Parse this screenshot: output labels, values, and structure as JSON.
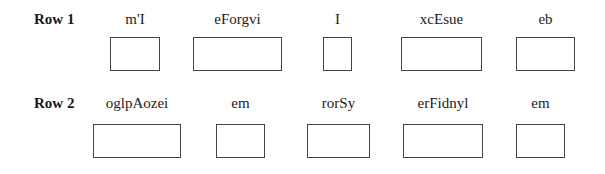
{
  "rows": [
    {
      "label": "Row 1",
      "fields": [
        {
          "label": "m'I"
        },
        {
          "label": "eForgvi"
        },
        {
          "label": "I"
        },
        {
          "label": "xcEsue"
        },
        {
          "label": "eb"
        }
      ]
    },
    {
      "label": "Row 2",
      "fields": [
        {
          "label": "oglpAozei"
        },
        {
          "label": "em"
        },
        {
          "label": "rorSy"
        },
        {
          "label": "erFidnyl"
        },
        {
          "label": "em"
        }
      ]
    }
  ]
}
